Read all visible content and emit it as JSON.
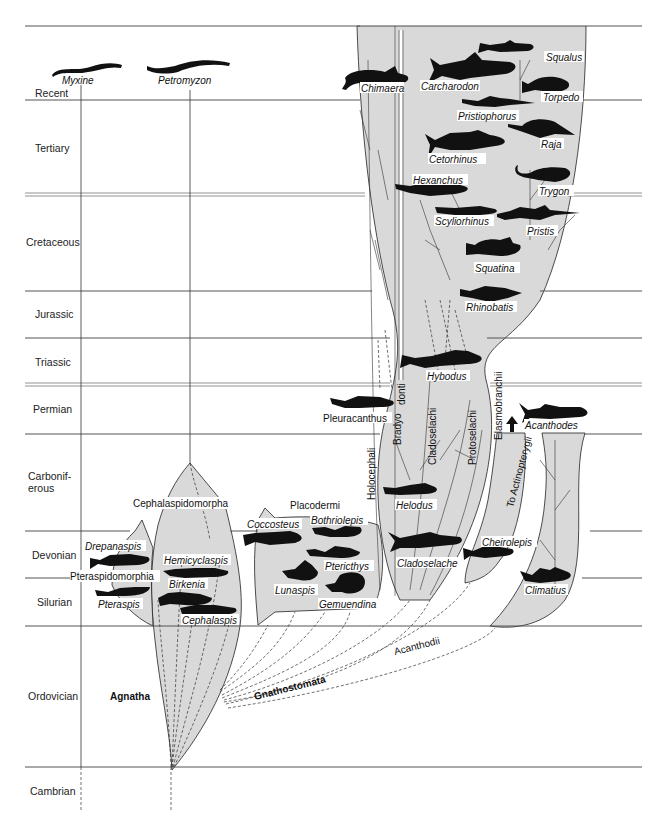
{
  "diagram": {
    "type": "phylogenetic-tree",
    "periods": [
      {
        "id": "recent",
        "label": "Recent",
        "y": 95
      },
      {
        "id": "tertiary",
        "label": "Tertiary",
        "y": 148
      },
      {
        "id": "cretaceous",
        "label": "Cretaceous",
        "y": 243
      },
      {
        "id": "jurassic",
        "label": "Jurassic",
        "y": 315
      },
      {
        "id": "triassic",
        "label": "Triassic",
        "y": 362
      },
      {
        "id": "permian",
        "label": "Permian",
        "y": 410
      },
      {
        "id": "carboniferous_1",
        "label": "Carbonif-",
        "y": 478
      },
      {
        "id": "carboniferous_2",
        "label": "erous",
        "y": 490
      },
      {
        "id": "devonian",
        "label": "Devonian",
        "y": 555
      },
      {
        "id": "silurian",
        "label": "Silurian",
        "y": 603
      },
      {
        "id": "ordovician",
        "label": "Ordovician",
        "y": 697
      },
      {
        "id": "cambrian",
        "label": "Cambrian",
        "y": 791
      }
    ],
    "living_agnathans": {
      "myxine": "Myxine",
      "petromyzon": "Petromyzon"
    },
    "groups": {
      "agnatha": "Agnatha",
      "gnathostomata": "Gnathostomata",
      "acanthodii": "Acanthodii",
      "cephalaspidomorpha": "Cephalaspidomorpha",
      "pteraspidomorphia": "Pteraspidomorphia",
      "placodermi": "Placodermi",
      "holocephali": "Holocephali",
      "bradyodonti_1": "Bradyo",
      "bradyodonti_2": "donti",
      "cladoselachi": "Cladoselachi",
      "protoselachi": "Protoselachi",
      "elasmobranchii": "Elasmobranchii",
      "to_actinopterygii": "To Actinopterygii"
    },
    "taxa": {
      "chimaera": "Chimaera",
      "carcharodon": "Carcharodon",
      "squalus": "Squalus",
      "torpedo": "Torpedo",
      "pristiophorus": "Pristiophorus",
      "raja": "Raja",
      "cetorhinus": "Cetorhinus",
      "trygon": "Trygon",
      "hexanchus": "Hexanchus",
      "scyliorhinus": "Scyliorhinus",
      "pristis": "Pristis",
      "squatina": "Squatina",
      "rhinobatis": "Rhinobatis",
      "hybodus": "Hybodus",
      "pleuracanthus": "Pleuracanthus",
      "acanthodes": "Acanthodes",
      "helodus": "Helodus",
      "cladoselache": "Cladoselache",
      "cheirolepis": "Cheirolepis",
      "climatius": "Climatius",
      "coccosteus": "Coccosteus",
      "bothriolepis": "Bothriolepis",
      "pterichthys": "Ptericthys",
      "lunaspis": "Lunaspis",
      "gemuendina": "Gemuendina",
      "drepanaspis": "Drepanaspis",
      "pteraspis": "Pteraspis",
      "hemicyclaspis": "Hemicyclaspis",
      "birkenia": "Birkenia",
      "cephalaspis": "Cephalaspis"
    },
    "colors": {
      "clade_fill": "#d9d9d9",
      "ink": "#111111",
      "background": "#ffffff"
    }
  }
}
